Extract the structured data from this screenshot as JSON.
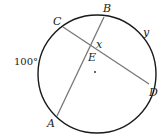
{
  "diagram": {
    "type": "circle-intersecting-chords",
    "points": {
      "A": "A",
      "B": "B",
      "C": "C",
      "D": "D",
      "E": "E"
    },
    "angle_labels": {
      "x": "x",
      "y": "y"
    },
    "arc_label": "100°",
    "colors": {
      "circle": "#1a1a1a",
      "chords": "#777777"
    }
  }
}
